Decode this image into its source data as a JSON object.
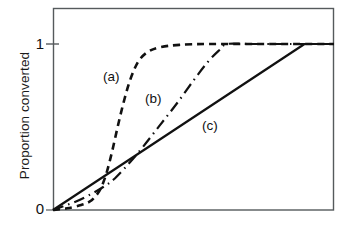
{
  "figure": {
    "type": "line-chart",
    "background": "#ffffff",
    "ink_color": "#111111"
  },
  "axes": {
    "y_label": "Proportion converted",
    "y_ticks": [
      {
        "value": "0",
        "pos": 0
      },
      {
        "value": "1",
        "pos": 1
      }
    ],
    "x_label": "",
    "x_ticks": [],
    "frame": {
      "left": 53,
      "right": 334,
      "top": 8,
      "bottom": 210
    }
  },
  "annotations": [
    {
      "text": "(a)",
      "x": 103,
      "y": 69
    },
    {
      "text": "(b)",
      "x": 145,
      "y": 91
    },
    {
      "text": "(c)",
      "x": 202,
      "y": 118
    }
  ],
  "chart_data": {
    "type": "line",
    "title": "",
    "xlabel": "",
    "ylabel": "Proportion converted",
    "xlim": [
      0,
      1
    ],
    "ylim": [
      0,
      1
    ],
    "grid": false,
    "legend": "inline-annotations",
    "y_tick_labels": [
      "0",
      "1"
    ],
    "x_tick_labels": [],
    "series": [
      {
        "name": "(a)",
        "label": "(a)",
        "style": "dashed",
        "dasharray": "7,5",
        "width": 2.6,
        "color": "#111111",
        "x": [
          0.0,
          0.05,
          0.1,
          0.13,
          0.15,
          0.17,
          0.19,
          0.21,
          0.23,
          0.25,
          0.27,
          0.29,
          0.31,
          0.34,
          0.38,
          0.45,
          0.55,
          0.7,
          0.85,
          1.0
        ],
        "y": [
          0.0,
          0.01,
          0.03,
          0.05,
          0.08,
          0.13,
          0.22,
          0.35,
          0.5,
          0.64,
          0.76,
          0.85,
          0.91,
          0.955,
          0.98,
          0.995,
          1.0,
          1.0,
          1.0,
          1.0
        ]
      },
      {
        "name": "(b)",
        "label": "(b)",
        "style": "dash-dot",
        "dasharray": "11,5,1.5,5",
        "width": 2.2,
        "color": "#111111",
        "x": [
          0.0,
          0.08,
          0.14,
          0.18,
          0.22,
          0.27,
          0.32,
          0.38,
          0.44,
          0.5,
          0.55,
          0.59,
          0.62,
          0.7,
          0.85,
          1.0
        ],
        "y": [
          0.0,
          0.05,
          0.1,
          0.14,
          0.19,
          0.28,
          0.38,
          0.51,
          0.64,
          0.78,
          0.89,
          0.96,
          1.0,
          1.0,
          1.0,
          1.0
        ]
      },
      {
        "name": "(c)",
        "label": "(c)",
        "style": "solid",
        "dasharray": "",
        "width": 2.2,
        "color": "#111111",
        "x": [
          0.0,
          0.895,
          1.0
        ],
        "y": [
          0.0,
          1.0,
          1.0
        ]
      }
    ]
  }
}
